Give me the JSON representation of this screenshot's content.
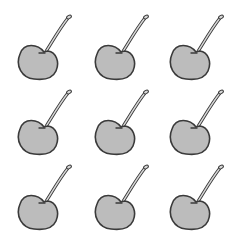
{
  "image": {
    "description": "3x3 grid of identical gray cherry line illustrations",
    "background": "#ffffff",
    "cherry": {
      "fill": "#bcbcbc",
      "outline": "#3a3a3a",
      "stem_fill": "#d8d8d8"
    },
    "grid": {
      "rows": 3,
      "cols": 3,
      "count": 9
    },
    "cherries": [
      {
        "row": 1,
        "col": 1,
        "x": 12,
        "y": 10
      },
      {
        "row": 1,
        "col": 2,
        "x": 89,
        "y": 10
      },
      {
        "row": 1,
        "col": 3,
        "x": 164,
        "y": 10
      },
      {
        "row": 2,
        "col": 1,
        "x": 12,
        "y": 85
      },
      {
        "row": 2,
        "col": 2,
        "x": 89,
        "y": 85
      },
      {
        "row": 2,
        "col": 3,
        "x": 164,
        "y": 85
      },
      {
        "row": 3,
        "col": 1,
        "x": 12,
        "y": 160
      },
      {
        "row": 3,
        "col": 2,
        "x": 89,
        "y": 160
      },
      {
        "row": 3,
        "col": 3,
        "x": 164,
        "y": 160
      }
    ]
  }
}
